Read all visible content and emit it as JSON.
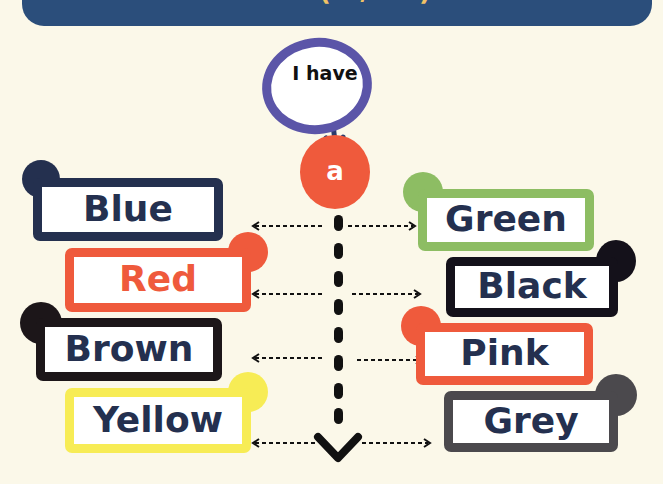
{
  "banner": {
    "text_prefix": "I have ",
    "text_highlight": "(a / an)",
    "text_suffix": " a",
    "blanks": 2,
    "bg_color": "#2b4e7b"
  },
  "speech_bubble": {
    "text": "I have",
    "border_color": "#5b55a8"
  },
  "article": {
    "text": "a",
    "color": "#ef5a3c"
  },
  "colors_left": [
    {
      "label": "Blue",
      "border": "#24304f",
      "text_color": "#24304f"
    },
    {
      "label": "Red",
      "border": "#ef5a3c",
      "text_color": "#ef5a3c"
    },
    {
      "label": "Brown",
      "border": "#1c1619",
      "text_color": "#24304f"
    },
    {
      "label": "Yellow",
      "border": "#f7ec55",
      "text_color": "#24304f"
    }
  ],
  "colors_right": [
    {
      "label": "Green",
      "border": "#8dbd63",
      "text_color": "#24304f"
    },
    {
      "label": "Black",
      "border": "#14111a",
      "text_color": "#24304f"
    },
    {
      "label": "Pink",
      "border": "#ef5a3c",
      "text_color": "#24304f"
    },
    {
      "label": "Grey",
      "border": "#4b494d",
      "text_color": "#24304f"
    }
  ]
}
